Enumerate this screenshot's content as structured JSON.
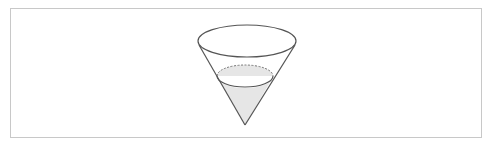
{
  "figure": {
    "colors": {
      "stroke": "#555555",
      "fill": "#e6e6e6",
      "frame": "#c8c8c8"
    },
    "cone": {
      "rim": {
        "cx": 247,
        "cy": 41,
        "rx": 49,
        "ry": 16
      },
      "apex": {
        "x": 245,
        "y": 125
      },
      "liquid_surface": {
        "cx": 245,
        "cy": 76,
        "rx": 28,
        "ry": 11
      }
    }
  }
}
